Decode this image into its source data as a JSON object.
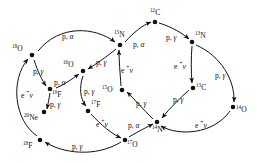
{
  "figure": {
    "ink_color": "#111111",
    "background_color": "#ffffff"
  },
  "nodes": [
    {
      "id": "O18",
      "mass": "18",
      "element": "O",
      "x": 32,
      "y": 55,
      "label_dx": -20,
      "label_dy": -10
    },
    {
      "id": "F19",
      "mass": "19",
      "element": "F",
      "x": 50,
      "y": 89,
      "label_dx": 2,
      "label_dy": 2
    },
    {
      "id": "Ne20",
      "mass": "20",
      "element": "Ne",
      "x": 44,
      "y": 112,
      "label_dx": -20,
      "label_dy": 2
    },
    {
      "id": "F18",
      "mass": "18",
      "element": "F",
      "x": 40,
      "y": 140,
      "label_dx": -17,
      "label_dy": 2
    },
    {
      "id": "O16",
      "mass": "16",
      "element": "O",
      "x": 83,
      "y": 71,
      "label_dx": -20,
      "label_dy": -10
    },
    {
      "id": "F17",
      "mass": "17",
      "element": "F",
      "x": 88,
      "y": 111,
      "label_dx": 3,
      "label_dy": -10
    },
    {
      "id": "O17",
      "mass": "17",
      "element": "O",
      "x": 125,
      "y": 140,
      "label_dx": 2,
      "label_dy": 1
    },
    {
      "id": "N15",
      "mass": "15",
      "element": "N",
      "x": 120,
      "y": 45,
      "label_dx": -6,
      "label_dy": -14
    },
    {
      "id": "O15",
      "mass": "15",
      "element": "O",
      "x": 122,
      "y": 90,
      "label_dx": -20,
      "label_dy": -4
    },
    {
      "id": "N14",
      "mass": "14",
      "element": "N",
      "x": 157,
      "y": 122,
      "label_dx": -5,
      "label_dy": 4
    },
    {
      "id": "C12",
      "mass": "12",
      "element": "C",
      "x": 155,
      "y": 22,
      "label_dx": -5,
      "label_dy": -13
    },
    {
      "id": "N13",
      "mass": "13",
      "element": "N",
      "x": 192,
      "y": 42,
      "label_dx": 3,
      "label_dy": -10
    },
    {
      "id": "C13",
      "mass": "13",
      "element": "C",
      "x": 193,
      "y": 88,
      "label_dx": 3,
      "label_dy": -4
    },
    {
      "id": "O14",
      "mass": "14",
      "element": "O",
      "x": 233,
      "y": 107,
      "label_dx": 3,
      "label_dy": -1
    }
  ],
  "reactions": [
    {
      "id": "r1",
      "from": "O18",
      "to": "N15",
      "label_type": "palpha",
      "x": 62,
      "y": 33
    },
    {
      "id": "r2",
      "from": "O18",
      "to": "F19",
      "label_type": "pgamma",
      "x": 33,
      "y": 68
    },
    {
      "id": "r3",
      "from": "F19",
      "to": "O16",
      "label_type": "palpha",
      "x": 54,
      "y": 79
    },
    {
      "id": "r4",
      "from": "F19",
      "to": "Ne20",
      "label_type": "pgamma",
      "x": 50,
      "y": 101
    },
    {
      "id": "r5",
      "from": "F18",
      "to": "O18",
      "label_type": "eplusnu",
      "x": 21,
      "y": 92
    },
    {
      "id": "r6",
      "from": "O17",
      "to": "F18",
      "label_type": "pgamma",
      "x": 72,
      "y": 143
    },
    {
      "id": "r7",
      "from": "N15",
      "to": "O16",
      "label_type": "pgamma",
      "x": 96,
      "y": 59
    },
    {
      "id": "r8",
      "from": "O16",
      "to": "F17",
      "label_type": "pgamma",
      "x": 84,
      "y": 88
    },
    {
      "id": "r9",
      "from": "F17",
      "to": "O17",
      "label_type": "eplusnu",
      "x": 96,
      "y": 121
    },
    {
      "id": "r10",
      "from": "O17",
      "to": "N14",
      "label_type": "palpha",
      "x": 128,
      "y": 122
    },
    {
      "id": "r11",
      "from": "O15",
      "to": "N15",
      "label_type": "eplusnu",
      "x": 121,
      "y": 67
    },
    {
      "id": "r12",
      "from": "N14",
      "to": "O15",
      "label_type": "pgamma",
      "x": 136,
      "y": 100
    },
    {
      "id": "r13",
      "from": "N15",
      "to": "C12",
      "label_type": "palpha",
      "x": 133,
      "y": 41
    },
    {
      "id": "r14",
      "from": "C12",
      "to": "N13",
      "label_type": "pgamma",
      "x": 166,
      "y": 34
    },
    {
      "id": "r15",
      "from": "N13",
      "to": "C13",
      "label_type": "eplusnu",
      "x": 174,
      "y": 63
    },
    {
      "id": "r16",
      "from": "C13",
      "to": "N14",
      "label_type": "pgamma",
      "x": 173,
      "y": 96
    },
    {
      "id": "r17",
      "from": "N13",
      "to": "O14",
      "label_type": "pgamma",
      "x": 215,
      "y": 72
    },
    {
      "id": "r18",
      "from": "O14",
      "to": "N14",
      "label_type": "eplusnu",
      "x": 195,
      "y": 122
    }
  ],
  "label_text": {
    "pgamma": "p, γ",
    "palpha": "p, α",
    "eplusnu": "e + ν"
  },
  "legend": {
    "p_gamma": "p, γ",
    "p_alpha": "p, α",
    "e_plus_nu": "e ⁺ ν"
  }
}
